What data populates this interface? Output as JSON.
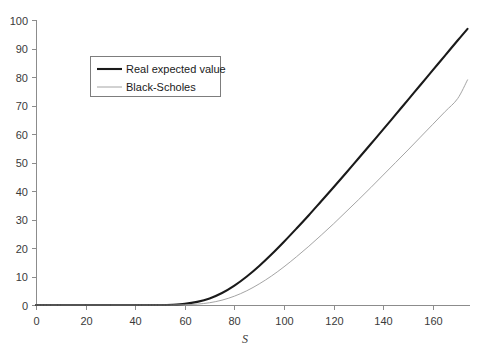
{
  "chart_data": {
    "type": "line",
    "title": "",
    "subtitle": "",
    "xlabel": "S",
    "ylabel": "",
    "xlim": [
      0,
      175
    ],
    "ylim": [
      0,
      100
    ],
    "grid": false,
    "legend_position": "upper-left-inside",
    "xticks": [
      0,
      20,
      40,
      60,
      80,
      100,
      120,
      140,
      160
    ],
    "yticks": [
      0,
      10,
      20,
      30,
      40,
      50,
      60,
      70,
      80,
      90,
      100
    ],
    "xtick_labels": [
      "0",
      "20",
      "40",
      "60",
      "80",
      "100",
      "120",
      "140",
      "160"
    ],
    "ytick_labels": [
      "0",
      "10",
      "20",
      "30",
      "40",
      "50",
      "60",
      "70",
      "80",
      "90",
      "100"
    ],
    "x": [
      0,
      10,
      20,
      30,
      40,
      50,
      55,
      60,
      65,
      70,
      75,
      80,
      85,
      90,
      95,
      100,
      105,
      110,
      115,
      120,
      125,
      130,
      135,
      140,
      145,
      150,
      155,
      160,
      165,
      170,
      174
    ],
    "series": [
      {
        "name": "Real expected value",
        "color": "#1a1a1a",
        "width": 2.1,
        "values": [
          0,
          0,
          0,
          0,
          0,
          0,
          0.1,
          0.4,
          1.1,
          2.3,
          4.2,
          6.8,
          10.0,
          13.7,
          17.8,
          22.2,
          26.8,
          31.5,
          36.4,
          41.3,
          46.3,
          51.4,
          56.5,
          61.6,
          66.8,
          72.0,
          77.2,
          82.4,
          87.6,
          92.8,
          96.9
        ]
      },
      {
        "name": "Black-Scholes",
        "color": "#9a9a9a",
        "width": 0.9,
        "values": [
          0,
          0,
          0,
          0,
          0,
          0,
          0.0,
          0.1,
          0.3,
          0.8,
          1.7,
          3.1,
          5.0,
          7.4,
          10.2,
          13.4,
          16.9,
          20.6,
          24.5,
          28.5,
          32.7,
          36.9,
          41.2,
          45.6,
          50.0,
          54.4,
          58.9,
          63.4,
          67.9,
          72.4,
          79.0
        ]
      }
    ],
    "legend": [
      {
        "label": "Real expected value",
        "color": "#1a1a1a",
        "width": 2.1
      },
      {
        "label": "Black-Scholes",
        "color": "#9a9a9a",
        "width": 0.9
      }
    ]
  }
}
